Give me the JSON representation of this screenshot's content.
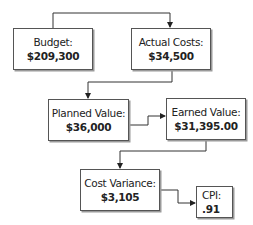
{
  "diagram": {
    "nodes": [
      {
        "id": "budget",
        "label": "Budget:",
        "value": "$209,300"
      },
      {
        "id": "actual_costs",
        "label": "Actual Costs:",
        "value": "$34,500"
      },
      {
        "id": "planned_value",
        "label": "Planned Value:",
        "value": "$36,000"
      },
      {
        "id": "earned_value",
        "label": "Earned Value:",
        "value": "$31,395.00"
      },
      {
        "id": "cost_variance",
        "label": "Cost Variance:",
        "value": "$3,105"
      },
      {
        "id": "cpi",
        "label": "CPI:",
        "value": ".91"
      }
    ],
    "edges": [
      {
        "from": "budget",
        "to": "actual_costs"
      },
      {
        "from": "actual_costs",
        "to": "planned_value"
      },
      {
        "from": "planned_value",
        "to": "earned_value"
      },
      {
        "from": "earned_value",
        "to": "cost_variance"
      },
      {
        "from": "cost_variance",
        "to": "cpi"
      }
    ],
    "colors": {
      "line": "#333333",
      "border": "#555555",
      "shadow": "#9a9a9a"
    }
  }
}
